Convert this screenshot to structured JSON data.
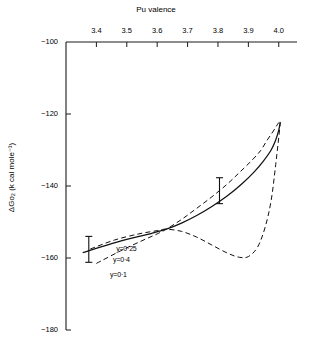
{
  "chart_data": {
    "type": "line",
    "title": "",
    "xlabel": "Pu valence",
    "ylabel": "ΔGo₂ (k cal mole⁻¹)",
    "xlabel_position": "top",
    "xlim": [
      3.3,
      4.06
    ],
    "ylim": [
      -180,
      -100
    ],
    "xticks": [
      3.4,
      3.5,
      3.6,
      3.7,
      3.8,
      3.9,
      4.0
    ],
    "xtick_labels": [
      "3.4",
      "3.5",
      "3.6",
      "3.7",
      "3.8",
      "3.9",
      "4.0"
    ],
    "yticks": [
      -100,
      -120,
      -140,
      -160,
      -180
    ],
    "ytick_labels": [
      "−100",
      "−120",
      "−140",
      "−160",
      "−180"
    ],
    "grid": false,
    "legend": "inline-labels",
    "axis_style": "top-x-and-left-y-spines",
    "series": [
      {
        "name": "y=0·25",
        "label": "y=0·25",
        "style": "solid",
        "color": "#111111",
        "points": [
          [
            3.355,
            -158.5
          ],
          [
            3.45,
            -156.0
          ],
          [
            3.52,
            -154.4
          ],
          [
            3.58,
            -153.2
          ],
          [
            3.63,
            -152.0
          ],
          [
            3.68,
            -150.3
          ],
          [
            3.73,
            -148.2
          ],
          [
            3.78,
            -145.7
          ],
          [
            3.83,
            -142.8
          ],
          [
            3.88,
            -139.3
          ],
          [
            3.92,
            -136.0
          ],
          [
            3.95,
            -133.0
          ],
          [
            3.975,
            -130.0
          ],
          [
            3.99,
            -127.2
          ],
          [
            4.0,
            -124.5
          ],
          [
            4.005,
            -122.2
          ]
        ]
      },
      {
        "name": "y=0·4",
        "label": "y=0·4",
        "style": "dashed",
        "color": "#111111",
        "points": [
          [
            3.4,
            -161.5
          ],
          [
            3.48,
            -158.0
          ],
          [
            3.55,
            -155.2
          ],
          [
            3.6,
            -153.3
          ],
          [
            3.63,
            -152.0
          ],
          [
            3.68,
            -149.3
          ],
          [
            3.73,
            -146.2
          ],
          [
            3.78,
            -143.0
          ],
          [
            3.83,
            -139.5
          ],
          [
            3.87,
            -136.3
          ],
          [
            3.91,
            -133.0
          ],
          [
            3.94,
            -130.2
          ],
          [
            3.96,
            -127.5
          ],
          [
            3.98,
            -125.0
          ],
          [
            3.995,
            -123.0
          ],
          [
            4.005,
            -121.8
          ]
        ]
      },
      {
        "name": "y=0·1",
        "label": "y=0·1",
        "style": "dashed",
        "color": "#111111",
        "points": [
          [
            3.38,
            -157.5
          ],
          [
            3.46,
            -155.0
          ],
          [
            3.54,
            -153.3
          ],
          [
            3.6,
            -152.4
          ],
          [
            3.63,
            -152.0
          ],
          [
            3.68,
            -152.6
          ],
          [
            3.73,
            -154.2
          ],
          [
            3.78,
            -156.4
          ],
          [
            3.83,
            -158.6
          ],
          [
            3.87,
            -159.8
          ],
          [
            3.9,
            -159.6
          ],
          [
            3.93,
            -157.0
          ],
          [
            3.955,
            -151.5
          ],
          [
            3.975,
            -144.0
          ],
          [
            3.99,
            -134.0
          ],
          [
            4.0,
            -126.5
          ],
          [
            4.005,
            -122.5
          ]
        ]
      }
    ],
    "error_bars": [
      {
        "x": 3.375,
        "y": -157.6,
        "yerr": 3.6
      },
      {
        "x": 3.805,
        "y": -141.3,
        "yerr": 3.6
      }
    ],
    "annotations": [
      {
        "text": "y=0·25",
        "x": 3.465,
        "y": -157.8
      },
      {
        "text": "y=0·4",
        "x": 3.455,
        "y": -160.8
      },
      {
        "text": "y=0·1",
        "x": 3.445,
        "y": -165.0
      }
    ]
  }
}
